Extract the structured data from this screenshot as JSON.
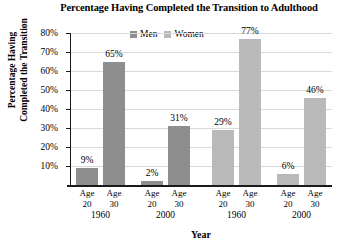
{
  "chart_data": {
    "type": "bar",
    "title": "Percentage Having Completed the Transition to Adulthood",
    "xlabel": "Year",
    "ylabel_line1": "Percentage Having",
    "ylabel_line2": "Completed the Transition",
    "ylim": [
      0,
      80
    ],
    "yticks": [
      "10%",
      "20%",
      "30%",
      "40%",
      "50%",
      "60%",
      "70%",
      "80%"
    ],
    "ytick_values": [
      10,
      20,
      30,
      40,
      50,
      60,
      70,
      80
    ],
    "grid": true,
    "legend_position": "top-center",
    "legend": [
      "Men",
      "Women"
    ],
    "colors": {
      "men": "#8e8e8e",
      "women": "#b9b9b9",
      "grid": "#d9d9d9",
      "axis": "#1a1a1a",
      "background": "#ffffff"
    },
    "series": [
      {
        "name": "Men",
        "values": [
          9,
          65,
          2,
          31
        ],
        "labels": [
          "9%",
          "65%",
          "2%",
          "31%"
        ]
      },
      {
        "name": "Women",
        "values": [
          29,
          77,
          6,
          46
        ],
        "labels": [
          "29%",
          "77%",
          "6%",
          "46%"
        ]
      }
    ],
    "bars": [
      {
        "group": "Men",
        "age": "Age 20",
        "year": "1960",
        "value": 9,
        "label": "9%"
      },
      {
        "group": "Men",
        "age": "Age 30",
        "year": "1960",
        "value": 65,
        "label": "65%"
      },
      {
        "group": "Men",
        "age": "Age 20",
        "year": "2000",
        "value": 2,
        "label": "2%"
      },
      {
        "group": "Men",
        "age": "Age 30",
        "year": "2000",
        "value": 31,
        "label": "31%"
      },
      {
        "group": "Women",
        "age": "Age 20",
        "year": "1960",
        "value": 29,
        "label": "29%"
      },
      {
        "group": "Women",
        "age": "Age 30",
        "year": "1960",
        "value": 77,
        "label": "77%"
      },
      {
        "group": "Women",
        "age": "Age 20",
        "year": "2000",
        "value": 6,
        "label": "6%"
      },
      {
        "group": "Women",
        "age": "Age 30",
        "year": "2000",
        "value": 46,
        "label": "46%"
      }
    ],
    "age_labels": [
      {
        "line1": "Age",
        "line2": "20"
      },
      {
        "line1": "Age",
        "line2": "30"
      },
      {
        "line1": "Age",
        "line2": "20"
      },
      {
        "line1": "Age",
        "line2": "30"
      },
      {
        "line1": "Age",
        "line2": "20"
      },
      {
        "line1": "Age",
        "line2": "30"
      },
      {
        "line1": "Age",
        "line2": "20"
      },
      {
        "line1": "Age",
        "line2": "30"
      }
    ],
    "year_labels": [
      "1960",
      "2000",
      "1960",
      "2000"
    ]
  }
}
